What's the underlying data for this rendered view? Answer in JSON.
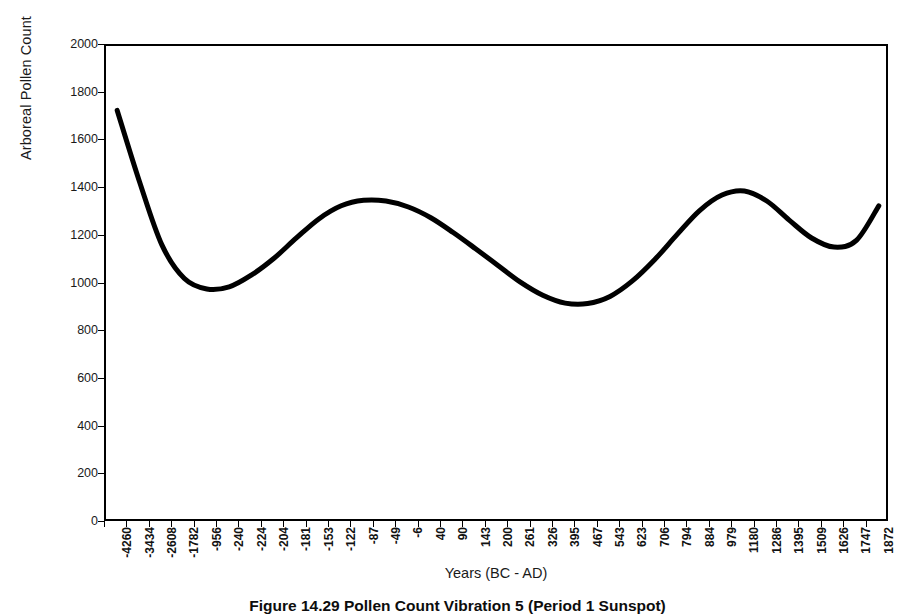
{
  "chart_data": {
    "type": "line",
    "title": "",
    "xlabel": "Years (BC - AD)",
    "ylabel": "Arboreal Pollen Count",
    "ylim": [
      0,
      2000
    ],
    "ytick_step": 200,
    "yticks": [
      0,
      200,
      400,
      600,
      800,
      1000,
      1200,
      1400,
      1600,
      1800,
      2000
    ],
    "grid": false,
    "legend": null,
    "line_color": "#000000",
    "line_width": 5,
    "categories": [
      "-4260",
      "-3434",
      "-2608",
      "-1782",
      "-956",
      "-240",
      "-224",
      "-204",
      "-181",
      "-153",
      "-122",
      "-87",
      "-49",
      "-6",
      "40",
      "90",
      "143",
      "200",
      "261",
      "326",
      "395",
      "467",
      "543",
      "623",
      "706",
      "794",
      "884",
      "979",
      "1180",
      "1286",
      "1395",
      "1509",
      "1626",
      "1747",
      "1872"
    ],
    "series": [
      {
        "name": "Arboreal Pollen Count",
        "values": [
          1730,
          1430,
          1165,
          1025,
          981,
          990,
          1040,
          1110,
          1195,
          1275,
          1330,
          1353,
          1350,
          1325,
          1280,
          1218,
          1150,
          1080,
          1010,
          955,
          922,
          920,
          950,
          1015,
          1105,
          1210,
          1310,
          1375,
          1392,
          1350,
          1270,
          1195,
          1157,
          1185,
          1330
        ]
      }
    ]
  },
  "caption": {
    "text": "Figure 14.29   Pollen Count Vibration 5 (Period 1 Sunspot)"
  }
}
